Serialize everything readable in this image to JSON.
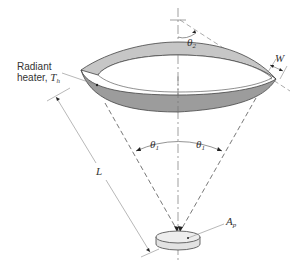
{
  "figure": {
    "heater_label_line1": "Radiant",
    "heater_label_line2": "heater, ",
    "heater_temp_symbol": "T",
    "heater_temp_sub": "h",
    "theta2_symbol": "θ",
    "theta2_sub": "2",
    "theta1_left_symbol": "θ",
    "theta1_left_sub": "1",
    "theta1_right_symbol": "θ",
    "theta1_right_sub": "1",
    "width_label": "W",
    "length_label": "L",
    "area_symbol": "A",
    "area_sub": "p"
  },
  "colors": {
    "ring_front": "#9a9a9a",
    "ring_back": "#c4c4c4",
    "line": "#555555",
    "dim_line": "#888888"
  }
}
